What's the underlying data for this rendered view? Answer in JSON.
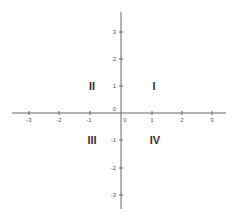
{
  "diagram": {
    "type": "cartesian-coordinate-plane",
    "axes": {
      "x": {
        "min": -3,
        "max": 3,
        "ticks": [
          "-3",
          "-2",
          "-1",
          "1",
          "2",
          "3"
        ]
      },
      "y": {
        "min": -3,
        "max": 3,
        "ticks": [
          "3",
          "2",
          "1",
          "-1",
          "-2",
          "-3"
        ]
      },
      "origin_labels": [
        "0",
        "0"
      ],
      "color": "#555555"
    },
    "quadrants": [
      {
        "id": "I",
        "label": "I"
      },
      {
        "id": "II",
        "label": "II"
      },
      {
        "id": "III",
        "label": "III"
      },
      {
        "id": "IV",
        "label": "IV"
      }
    ]
  }
}
